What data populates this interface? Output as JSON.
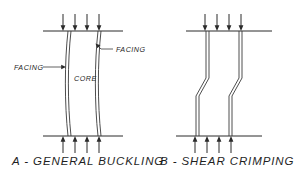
{
  "figure": {
    "background_color": "#ffffff",
    "line_color": "#2b2b2b",
    "text_color": "#1f1f1f",
    "width": 298,
    "height": 173
  },
  "panels": [
    {
      "id": "a",
      "caption": "A - GENERAL BUCKLING",
      "top_load_arrow_count": 4,
      "bottom_load_arrow_count": 4,
      "top_arrow_direction": "down",
      "bottom_arrow_direction": "up",
      "annotations": [
        {
          "id": "facing-left",
          "label": "FACING"
        },
        {
          "id": "core",
          "label": "CORE"
        },
        {
          "id": "facing-right",
          "label": "FACING"
        }
      ]
    },
    {
      "id": "b",
      "caption": "B - SHEAR CRIMPING",
      "top_load_arrow_count": 4,
      "bottom_load_arrow_count": 4,
      "top_arrow_direction": "down",
      "bottom_arrow_direction": "up",
      "annotations": []
    }
  ]
}
